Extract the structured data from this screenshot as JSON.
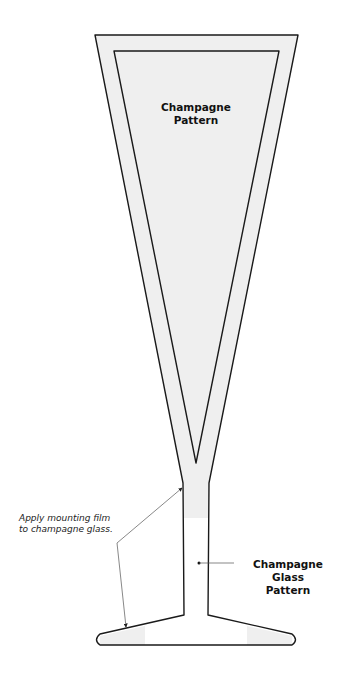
{
  "diagram": {
    "labels": {
      "cup_pattern": [
        "Champagne",
        "Pattern"
      ],
      "glass_pattern": [
        "Champagne Glass",
        "Pattern"
      ],
      "note": [
        "Apply mounting film",
        "to champagne glass."
      ]
    },
    "colors": {
      "outline": "#1a1a1a",
      "fill": "#efefef",
      "background": "#ffffff",
      "leader": "#555555"
    }
  }
}
